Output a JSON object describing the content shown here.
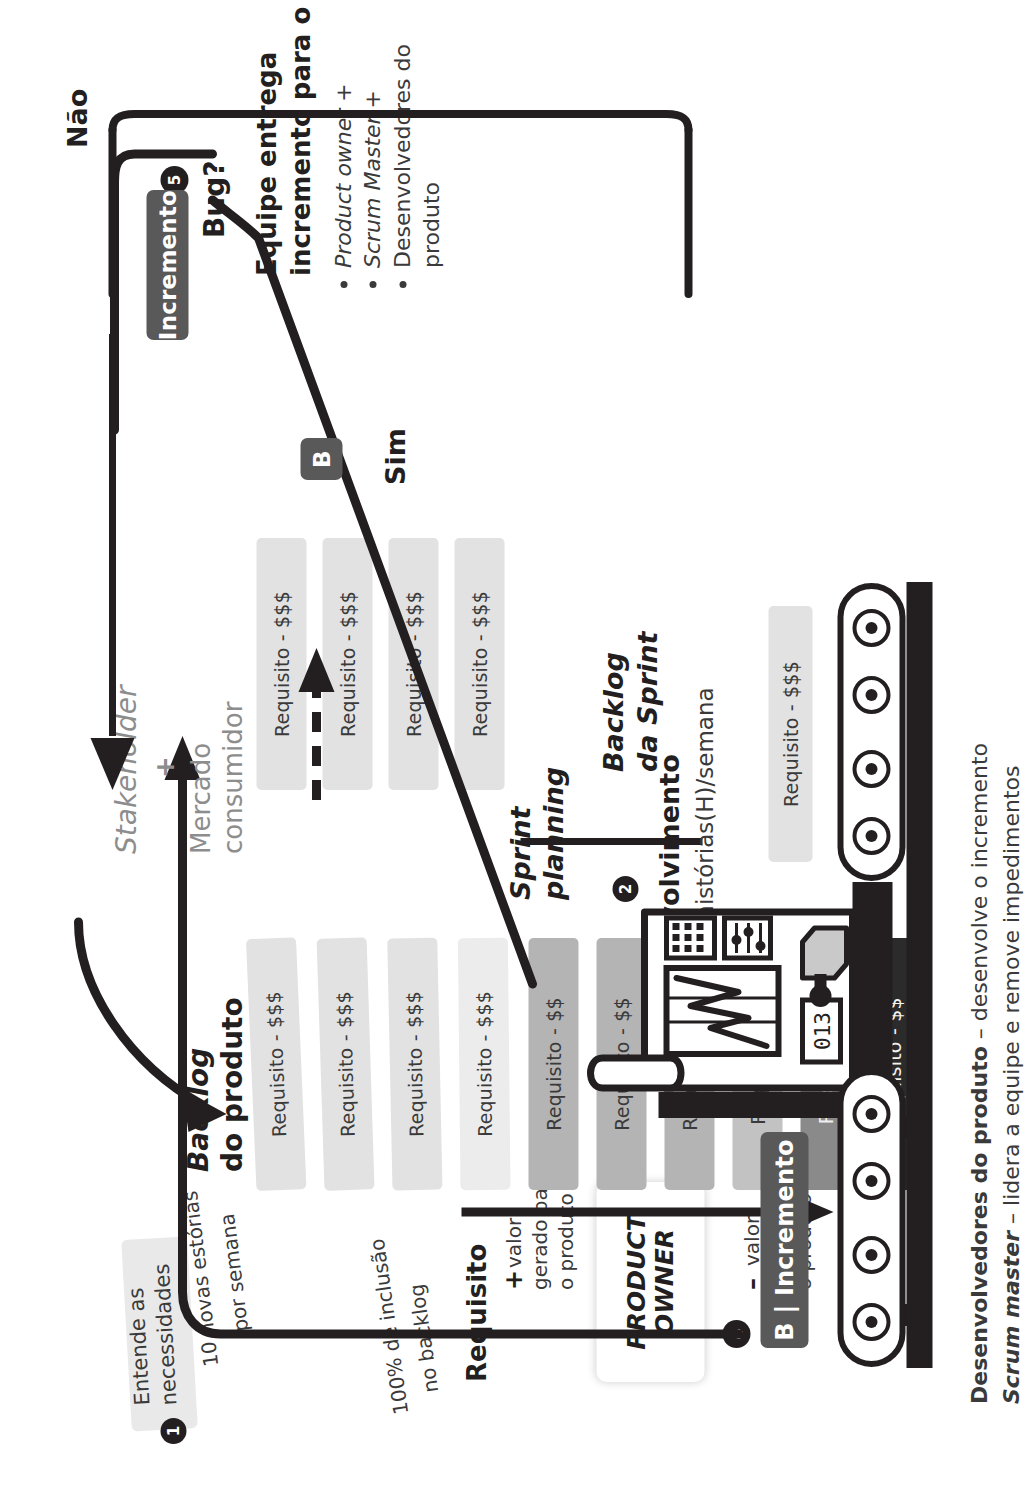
{
  "diagram": {
    "accent_dark": "#231f20",
    "accent_chip": "#595959"
  },
  "steps": {
    "one": "1",
    "two": "2",
    "three": "3",
    "four": "4",
    "five": "5"
  },
  "step1": {
    "callout_line1": "Entende as",
    "callout_line2": "necessidades",
    "note_line1": "10 novas estórias",
    "note_line2": "por semana"
  },
  "product_backlog": {
    "title_line1": "Backlog",
    "title_line2": "do produto",
    "inclusion_note_line1": "100% de inclusão",
    "inclusion_note_line2": "no backlog",
    "legend_title": "Requisito",
    "legend_plus_sign": "+",
    "legend_plus_line1": "valor",
    "legend_plus_line2": "gerado para",
    "legend_plus_line3": "o produto",
    "legend_minus_sign": "–",
    "legend_minus_line1": "valor",
    "legend_minus_line2": "gerado para",
    "legend_minus_line3": "o produto",
    "cards": [
      {
        "label": "Requisito - $$$",
        "bg": "#e2e2e2",
        "fg": "#3a3a3a"
      },
      {
        "label": "Requisito - $$$",
        "bg": "#e2e2e2",
        "fg": "#3a3a3a"
      },
      {
        "label": "Requisito - $$$",
        "bg": "#e2e2e2",
        "fg": "#3a3a3a"
      },
      {
        "label": "Requisito - $$$",
        "bg": "#ececec",
        "fg": "#3a3a3a"
      },
      {
        "label": "Requisito - $$",
        "bg": "#b4b4b4",
        "fg": "#3a3a3a"
      },
      {
        "label": "Requisito - $$",
        "bg": "#b4b4b4",
        "fg": "#3a3a3a"
      },
      {
        "label": "Requisito - $$",
        "bg": "#b4b4b4",
        "fg": "#3a3a3a"
      },
      {
        "label": "Requisito - $",
        "bg": "#c2c2c2",
        "fg": "#3a3a3a"
      },
      {
        "label": "Requisito $$",
        "bg": "#8a8a8a",
        "fg": "#efefef"
      },
      {
        "label": "Requisito - $$",
        "bg": "#2b2b2b",
        "fg": "#f2f2f2"
      }
    ]
  },
  "product_owner": {
    "line1": "PRODUCT",
    "line2": "OWNER"
  },
  "sprint_planning": {
    "title_line1": "Sprint",
    "title_line2": "planning"
  },
  "sprint_backlog": {
    "title_line1": "Backlog",
    "title_line2": "da Sprint",
    "cards": [
      {
        "label": "Requisito - $$$",
        "bg": "#e2e2e2",
        "fg": "#3a3a3a"
      },
      {
        "label": "Requisito - $$$",
        "bg": "#e2e2e2",
        "fg": "#3a3a3a"
      },
      {
        "label": "Requisito - $$$",
        "bg": "#e2e2e2",
        "fg": "#3a3a3a"
      },
      {
        "label": "Requisito - $$$",
        "bg": "#e2e2e2",
        "fg": "#3a3a3a"
      }
    ],
    "conveyor_card": {
      "label": "Requisito - $$$",
      "bg": "#e2e2e2",
      "fg": "#3a3a3a"
    }
  },
  "development": {
    "title": "Desenvolvimento",
    "subtitle": "Média 5 histórias(H)/semana",
    "machine_display_digits": "013"
  },
  "increment": {
    "chip_label": "B | Incremento"
  },
  "decision": {
    "label": "Bug?",
    "yes": "Sim",
    "no": "Não"
  },
  "delivery": {
    "chip_increment": "Incremento",
    "chip_b": "B",
    "title_line1": "Equipe entrega",
    "title_line2": "incremento para o cliente",
    "bullets": [
      "Product owner +",
      "Scrum Master +",
      "Desenvolvedores do\nproduto"
    ]
  },
  "stakeholder": {
    "line1": "Stakeholder",
    "plus": "+",
    "line2": "Mercado",
    "line3": "consumidor"
  },
  "roles_footnote": {
    "dev_bold": "Desenvolvedores do produto",
    "dev_rest": " – desenvolve o incremento",
    "sm_bold": "Scrum master",
    "sm_rest": " – lidera a equipe e remove impedimentos"
  }
}
